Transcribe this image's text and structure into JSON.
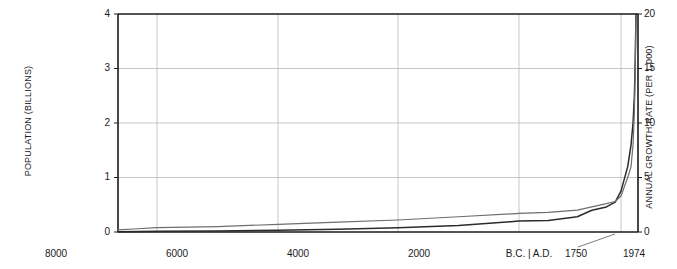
{
  "chart_data": {
    "type": "line",
    "title": "",
    "xlabel": "",
    "ylabel": "POPULATION (BILLIONS)",
    "y2label": "ANNUAL GROWTH RATE (PER 1,000)",
    "grid": true,
    "legend": "none",
    "xlim": [
      -8000,
      1974
    ],
    "ylim": [
      0,
      4
    ],
    "y2lim": [
      0,
      20
    ],
    "x_tick_labels": [
      "8000",
      "6000",
      "4000",
      "2000",
      "B.C. | A.D.",
      "1750",
      "1974"
    ],
    "x_tick_values": [
      -8000,
      -6000,
      -4000,
      -2000,
      0,
      1750,
      1974
    ],
    "y_tick_labels": [
      "0",
      "1",
      "2",
      "3",
      "4"
    ],
    "y_tick_values": [
      0,
      1,
      2,
      3,
      4
    ],
    "y2_tick_labels": [
      "0",
      "5",
      "10",
      "15",
      "20"
    ],
    "y2_tick_values": [
      0,
      5,
      10,
      15,
      20
    ],
    "series": [
      {
        "name": "Population",
        "axis": "left",
        "color": "#2b2b2b",
        "x": [
          -8000,
          -7000,
          -6000,
          -5000,
          -4000,
          -3000,
          -2000,
          -1000,
          0,
          500,
          1000,
          1250,
          1500,
          1650,
          1750,
          1850,
          1900,
          1930,
          1950,
          1960,
          1970,
          1974
        ],
        "values": [
          0.005,
          0.008,
          0.012,
          0.02,
          0.03,
          0.05,
          0.08,
          0.12,
          0.2,
          0.21,
          0.28,
          0.4,
          0.46,
          0.55,
          0.75,
          1.2,
          1.6,
          2.0,
          2.5,
          3.0,
          3.7,
          4.0
        ]
      },
      {
        "name": "Annual growth rate",
        "axis": "right",
        "color": "#6e6e6e",
        "x": [
          -8000,
          -7000,
          -6000,
          -5000,
          -4000,
          -3000,
          -2000,
          -1000,
          0,
          500,
          1000,
          1250,
          1500,
          1650,
          1750,
          1850,
          1900,
          1930,
          1950,
          1960,
          1970,
          1974
        ],
        "values": [
          0.2,
          0.3,
          0.4,
          0.5,
          0.7,
          0.9,
          1.1,
          1.4,
          1.7,
          1.8,
          2.0,
          2.3,
          2.6,
          2.8,
          3.3,
          5.0,
          6.0,
          8.0,
          11.0,
          14.0,
          18.0,
          19.5
        ]
      }
    ],
    "annotations": [
      {
        "name": "leader-line-1750",
        "text": "1750"
      }
    ]
  },
  "labels": {
    "y_left_title": "POPULATION (BILLIONS)",
    "y_right_title": "ANNUAL GROWTH RATE (PER 1,000)",
    "y_left": {
      "t0": "0",
      "t1": "1",
      "t2": "2",
      "t3": "3",
      "t4": "4"
    },
    "y_right": {
      "t0": "0",
      "t1": "5",
      "t2": "10",
      "t3": "15",
      "t4": "20"
    },
    "x": {
      "t0": "8000",
      "t1": "6000",
      "t2": "4000",
      "t3": "2000",
      "t4": "B.C. | A.D.",
      "t5": "1750",
      "t6": "1974"
    }
  },
  "colors": {
    "population_line": "#2b2b2b",
    "growth_line": "#6e6e6e",
    "grid": "#b9b9b9",
    "axis": "#1a1a1a",
    "background": "#ffffff"
  }
}
